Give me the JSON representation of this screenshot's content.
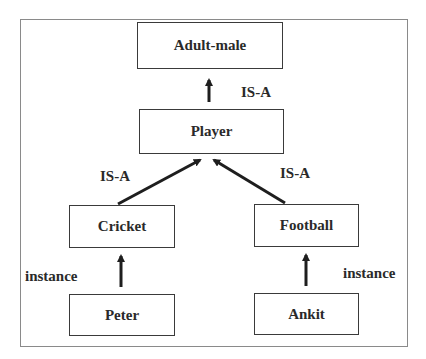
{
  "diagram": {
    "type": "semantic-network",
    "nodes": [
      {
        "id": "adult-male",
        "label": "Adult-male"
      },
      {
        "id": "player",
        "label": "Player"
      },
      {
        "id": "cricket",
        "label": "Cricket"
      },
      {
        "id": "football",
        "label": "Football"
      },
      {
        "id": "peter",
        "label": "Peter"
      },
      {
        "id": "ankit",
        "label": "Ankit"
      }
    ],
    "edges": [
      {
        "from": "player",
        "to": "adult-male",
        "label": "IS-A"
      },
      {
        "from": "cricket",
        "to": "player",
        "label": "IS-A"
      },
      {
        "from": "football",
        "to": "player",
        "label": "IS-A"
      },
      {
        "from": "peter",
        "to": "cricket",
        "label": "instance"
      },
      {
        "from": "ankit",
        "to": "football",
        "label": "instance"
      }
    ],
    "colors": {
      "stroke": "#2a2a2a",
      "frame": "#8a8a8a",
      "background": "#ffffff"
    }
  }
}
